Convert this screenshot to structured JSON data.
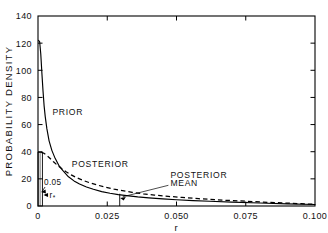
{
  "chart_data": {
    "type": "line",
    "title": "",
    "xlabel": "r",
    "ylabel": "PROBABILITY DENSITY",
    "xlim": [
      0,
      0.1
    ],
    "ylim": [
      0,
      140
    ],
    "grid": false,
    "legend_position": "inline-annotations",
    "xticks": [
      0,
      0.025,
      0.05,
      0.075,
      0.1
    ],
    "xticklabels": [
      "0",
      "0.025",
      "0.050",
      "0.075",
      "0.100"
    ],
    "yticks": [
      0,
      20,
      40,
      60,
      80,
      100,
      120,
      140
    ],
    "yticklabels": [
      "0",
      "20",
      "40",
      "60",
      "80",
      "100",
      "120",
      "140"
    ],
    "series": [
      {
        "name": "PRIOR",
        "style": "solid",
        "color": "#000000",
        "x": [
          0.0002,
          0.0006,
          0.001,
          0.0014,
          0.0018,
          0.0022,
          0.0026,
          0.0032,
          0.004,
          0.005,
          0.006,
          0.0075,
          0.009,
          0.011,
          0.013,
          0.015,
          0.0175,
          0.02,
          0.023,
          0.026,
          0.029,
          0.032,
          0.036,
          0.04,
          0.045,
          0.05,
          0.056,
          0.062,
          0.07,
          0.08,
          0.09,
          0.1
        ],
        "y": [
          122,
          121,
          112,
          98,
          85,
          74,
          66,
          57,
          48,
          41,
          36,
          30,
          26,
          21.5,
          18.5,
          16.2,
          14.0,
          12.3,
          10.6,
          9.4,
          8.4,
          7.6,
          6.7,
          6.0,
          5.2,
          4.6,
          4.0,
          3.5,
          2.9,
          2.2,
          1.6,
          1.1
        ]
      },
      {
        "name": "POSTERIOR",
        "style": "dashed",
        "color": "#000000",
        "x": [
          0.0012,
          0.002,
          0.003,
          0.0042,
          0.0055,
          0.007,
          0.0085,
          0.01,
          0.012,
          0.014,
          0.0165,
          0.019,
          0.0215,
          0.0245,
          0.0275,
          0.0305,
          0.034,
          0.038,
          0.042,
          0.047,
          0.052,
          0.058,
          0.065,
          0.072,
          0.08,
          0.088,
          0.095,
          0.1
        ],
        "y": [
          39.5,
          39.0,
          37.6,
          35.4,
          32.8,
          30.0,
          27.6,
          25.4,
          22.9,
          20.8,
          18.7,
          16.9,
          15.4,
          13.8,
          12.4,
          11.3,
          10.1,
          9.0,
          8.1,
          7.1,
          6.3,
          5.4,
          4.5,
          3.8,
          3.0,
          2.3,
          1.7,
          1.2
        ]
      }
    ],
    "annotations": [
      {
        "name": "prior-label",
        "text": "PRIOR",
        "x": 0.0052,
        "y": 67
      },
      {
        "name": "posterior-label",
        "text": "POSTERIOR",
        "x": 0.0122,
        "y": 28.5
      },
      {
        "name": "posterior-mean-label-line1",
        "text": "POSTERIOR",
        "x": 0.0478,
        "y": 20.5
      },
      {
        "name": "posterior-mean-label-line2",
        "text": "MEAN",
        "x": 0.0478,
        "y": 14.5
      },
      {
        "name": "prior-mass-label",
        "text": "0.05",
        "x": 0.0022,
        "y": 15.5
      },
      {
        "name": "r-star-label",
        "text": "r",
        "subscript": "*",
        "x": 0.0042,
        "y": 6.2
      }
    ],
    "shaded_region": {
      "name": "prior-point-mass",
      "hatch": "vertical-lines",
      "x_start": 0.0,
      "x_end": 0.0016,
      "y_start": 0.0,
      "y_end": 39.5,
      "area_label": "0.05"
    },
    "markers": [
      {
        "name": "posterior-mean-tick",
        "x": 0.0295,
        "y_from": 0,
        "y_to": 9.0
      }
    ]
  }
}
